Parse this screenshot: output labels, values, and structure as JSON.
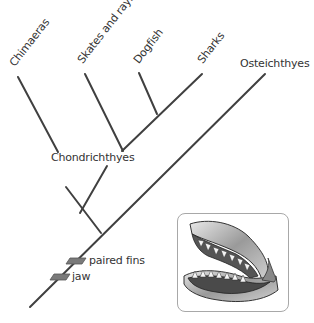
{
  "taxa": {
    "chimaeras": "Chimaeras",
    "skates": "Skates and rays",
    "dogfish": "Dogfish",
    "sharks": "Sharks",
    "osteichthyes": "Osteichthyes"
  },
  "clade_labels": {
    "chondrichthyes": "Chondrichthyes"
  },
  "characters": [
    {
      "label": "paired fins"
    },
    {
      "label": "jaw"
    }
  ],
  "illustration": {
    "subject": "shark-jaw"
  },
  "colors": {
    "line": "#404040",
    "marker_fill": "#7a7a7a",
    "text": "#333333"
  }
}
